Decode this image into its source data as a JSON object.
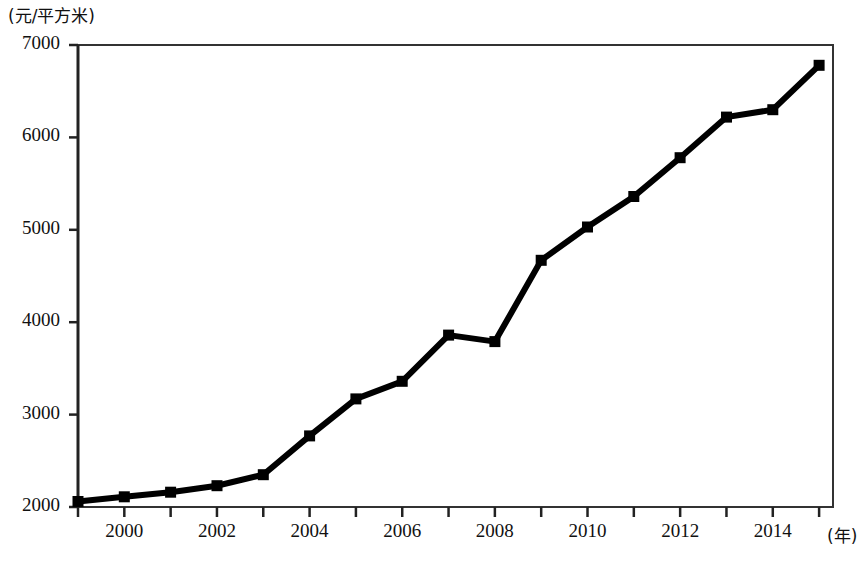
{
  "chart_data": {
    "type": "line",
    "title": "",
    "subtitle": "",
    "xlabel": "(年)",
    "ylabel": "(元/平方米)",
    "x": [
      1999,
      2000,
      2001,
      2002,
      2003,
      2004,
      2005,
      2006,
      2007,
      2008,
      2009,
      2010,
      2011,
      2012,
      2013,
      2014,
      2015
    ],
    "values": [
      2060,
      2110,
      2160,
      2230,
      2350,
      2770,
      3170,
      3360,
      3860,
      3790,
      4670,
      5030,
      5360,
      5780,
      6220,
      6300,
      6780
    ],
    "series": [
      {
        "name": "",
        "values": [
          2060,
          2110,
          2160,
          2230,
          2350,
          2770,
          3170,
          3360,
          3860,
          3790,
          4670,
          5030,
          5360,
          5780,
          6220,
          6300,
          6780
        ]
      }
    ],
    "xlim": [
      1999,
      2015.3
    ],
    "ylim": [
      2000,
      7000
    ],
    "ytick_labels": [
      "7000",
      "6000",
      "5000",
      "4000",
      "3000",
      "2000"
    ],
    "ytick_values": [
      7000,
      6000,
      5000,
      4000,
      3000,
      2000
    ],
    "xtick_labels": [
      "2000",
      "2002",
      "2004",
      "2006",
      "2008",
      "2010",
      "2012",
      "2014"
    ],
    "xtick_values": [
      2000,
      2002,
      2004,
      2006,
      2008,
      2010,
      2012,
      2014
    ],
    "xtick_minor_values": [
      1999,
      2000,
      2001,
      2002,
      2003,
      2004,
      2005,
      2006,
      2007,
      2008,
      2009,
      2010,
      2011,
      2012,
      2013,
      2014,
      2015
    ],
    "grid": false,
    "legend": null,
    "legend_position": "none",
    "marker": "square",
    "line_color": "#000000",
    "marker_color": "#000000",
    "axis_color": "#333333",
    "background_color": "#ffffff",
    "annotations": []
  },
  "axes": {
    "y_unit_label": "(元/平方米)",
    "x_unit_label": "(年)"
  }
}
